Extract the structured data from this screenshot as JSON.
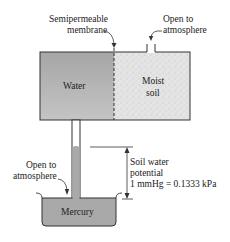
{
  "diagram": {
    "labels": {
      "membrane_line1": "Semipermeable",
      "membrane_line2": "membrane",
      "vent_top_line1": "Open to",
      "vent_top_line2": "atmosphere",
      "water": "Water",
      "soil_line1": "Moist",
      "soil_line2": "soil",
      "vent_left_line1": "Open to",
      "vent_left_line2": "atmosphere",
      "potential_line1": "Soil water",
      "potential_line2": "potential",
      "potential_line3": "1 mmHg = 0.1333 kPa",
      "mercury": "Mercury"
    },
    "colors": {
      "water_fill": "#b4b4b4",
      "soil_fill": "#e2e2e2",
      "mercury_fill": "#a9a9a9",
      "outline": "#333333"
    }
  }
}
